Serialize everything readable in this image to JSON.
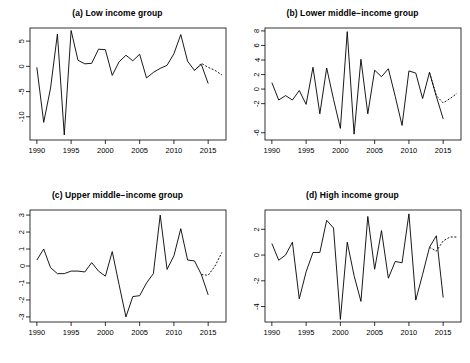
{
  "figure": {
    "panel_count": 4,
    "line_color": "#000000",
    "box_color": "#000000",
    "background": "#ffffff"
  },
  "panels": [
    {
      "id": "a",
      "title": "(a) Low income group",
      "chart_data": {
        "type": "line",
        "title": "(a) Low income group",
        "xlabel": "",
        "ylabel": "",
        "xlim": [
          1989,
          2017.6
        ],
        "ylim": [
          -14.6,
          7.6
        ],
        "xticks": [
          1990,
          1995,
          2000,
          2005,
          2010,
          2015
        ],
        "yticks": [
          -10,
          -5,
          0,
          5
        ],
        "grid": false,
        "legend": "none",
        "series": [
          {
            "name": "observed",
            "style": "solid",
            "x": [
              1990,
              1991,
              1992,
              1993,
              1994,
              1995,
              1996,
              1997,
              1998,
              1999,
              2000,
              2001,
              2002,
              2003,
              2004,
              2005,
              2006,
              2007,
              2008,
              2009,
              2010,
              2011,
              2012,
              2013,
              2014,
              2015
            ],
            "y": [
              -0.2,
              -11.1,
              -4.3,
              6.4,
              -13.6,
              7.1,
              1.2,
              0.5,
              0.6,
              3.4,
              3.3,
              -1.8,
              0.9,
              2.2,
              1.1,
              2.4,
              -2.3,
              -1.2,
              -0.4,
              0.2,
              2.5,
              6.3,
              1.0,
              -0.8,
              0.4,
              -3.4
            ]
          },
          {
            "name": "forecast",
            "style": "dotted",
            "x": [
              2013,
              2014,
              2015,
              2016,
              2017
            ],
            "y": [
              -0.8,
              0.6,
              -0.2,
              -0.8,
              -1.7
            ]
          }
        ]
      }
    },
    {
      "id": "b",
      "title": "(b) Lower middle−income group",
      "chart_data": {
        "type": "line",
        "title": "(b) Lower middle-income group",
        "xlabel": "",
        "ylabel": "",
        "xlim": [
          1989,
          2017.6
        ],
        "ylim": [
          -7.0,
          8.4
        ],
        "xticks": [
          1990,
          1995,
          2000,
          2005,
          2010,
          2015
        ],
        "yticks": [
          -6,
          -2,
          0,
          2,
          4,
          6,
          8
        ],
        "grid": false,
        "legend": "none",
        "series": [
          {
            "name": "observed",
            "style": "solid",
            "x": [
              1990,
              1991,
              1992,
              1993,
              1994,
              1995,
              1996,
              1997,
              1998,
              1999,
              2000,
              2001,
              2002,
              2003,
              2004,
              2005,
              2006,
              2007,
              2008,
              2009,
              2010,
              2011,
              2012,
              2013,
              2014,
              2015
            ],
            "y": [
              0.9,
              -1.5,
              -0.9,
              -1.5,
              -0.2,
              -2.1,
              3.0,
              -3.4,
              2.9,
              -1.4,
              -5.4,
              7.9,
              -6.2,
              4.1,
              -3.4,
              2.6,
              1.7,
              2.8,
              -1.0,
              -5.0,
              2.5,
              2.2,
              -1.3,
              2.3,
              -1.0,
              -4.1
            ]
          },
          {
            "name": "forecast",
            "style": "dotted",
            "x": [
              2013,
              2014,
              2015,
              2016,
              2017
            ],
            "y": [
              2.3,
              -0.9,
              -1.9,
              -1.3,
              -0.6
            ]
          }
        ]
      }
    },
    {
      "id": "c",
      "title": "(c) Upper middle−income group",
      "chart_data": {
        "type": "line",
        "title": "(c) Upper middle-income group",
        "xlabel": "",
        "ylabel": "",
        "xlim": [
          1989,
          2017.6
        ],
        "ylim": [
          -3.3,
          3.3
        ],
        "xticks": [
          1990,
          1995,
          2000,
          2005,
          2010,
          2015
        ],
        "yticks": [
          -3,
          -2,
          -1,
          0,
          1,
          2,
          3
        ],
        "grid": false,
        "legend": "none",
        "series": [
          {
            "name": "observed",
            "style": "solid",
            "x": [
              1990,
              1991,
              1992,
              1993,
              1994,
              1995,
              1996,
              1997,
              1998,
              1999,
              2000,
              2001,
              2002,
              2003,
              2004,
              2005,
              2006,
              2007,
              2008,
              2009,
              2010,
              2011,
              2012,
              2013,
              2014,
              2015
            ],
            "y": [
              0.35,
              1.0,
              -0.1,
              -0.45,
              -0.45,
              -0.3,
              -0.3,
              -0.35,
              0.2,
              -0.3,
              -0.6,
              0.85,
              -1.1,
              -3.0,
              -1.8,
              -1.75,
              -1.0,
              -0.45,
              3.0,
              -0.2,
              0.6,
              2.2,
              0.35,
              0.3,
              -0.5,
              -1.7
            ]
          },
          {
            "name": "forecast",
            "style": "dotted",
            "x": [
              2014,
              2015,
              2016,
              2017
            ],
            "y": [
              -0.5,
              -0.55,
              0.0,
              0.8
            ]
          }
        ]
      }
    },
    {
      "id": "d",
      "title": "(d) High income group",
      "chart_data": {
        "type": "line",
        "title": "(d) High income group",
        "xlabel": "",
        "ylabel": "",
        "xlim": [
          1989,
          2017.6
        ],
        "ylim": [
          -5.2,
          3.5
        ],
        "xticks": [
          1990,
          1995,
          2000,
          2005,
          2010,
          2015
        ],
        "yticks": [
          -4,
          -2,
          0,
          2
        ],
        "grid": false,
        "legend": "none",
        "series": [
          {
            "name": "observed",
            "style": "solid",
            "x": [
              1990,
              1991,
              1992,
              1993,
              1994,
              1995,
              1996,
              1997,
              1998,
              1999,
              2000,
              2001,
              2002,
              2003,
              2004,
              2005,
              2006,
              2007,
              2008,
              2009,
              2010,
              2011,
              2012,
              2013,
              2014,
              2015
            ],
            "y": [
              0.9,
              -0.4,
              0.0,
              1.0,
              -3.4,
              -1.3,
              0.2,
              0.2,
              2.7,
              2.1,
              -5.0,
              1.0,
              -1.6,
              -3.6,
              3.0,
              -1.1,
              1.9,
              -1.8,
              -0.5,
              -0.6,
              3.2,
              -3.5,
              -1.5,
              0.6,
              1.5,
              -3.3
            ]
          },
          {
            "name": "forecast",
            "style": "dotted",
            "x": [
              2013,
              2014,
              2015,
              2016,
              2017
            ],
            "y": [
              0.6,
              0.3,
              1.1,
              1.4,
              1.4
            ]
          }
        ]
      }
    }
  ]
}
